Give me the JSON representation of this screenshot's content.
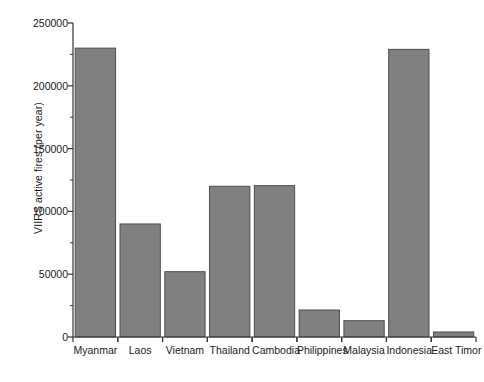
{
  "chart_data": {
    "type": "bar",
    "title": "",
    "xlabel": "",
    "ylabel": "VIIRS active fires (per year)",
    "categories": [
      "Myanmar",
      "Laos",
      "Vietnam",
      "Thailand",
      "Cambodia",
      "Philippines",
      "Malaysia",
      "Indonesia",
      "East Timor"
    ],
    "values": [
      230000,
      90000,
      52000,
      120000,
      120500,
      21500,
      13000,
      229000,
      4000
    ],
    "ylim": [
      0,
      250000
    ],
    "ytick_labels": [
      "0",
      "50000",
      "100000",
      "150000",
      "200000",
      "250000"
    ],
    "ytick_values": [
      0,
      50000,
      100000,
      150000,
      200000,
      250000
    ],
    "minor_tick_interval": 25000,
    "grid": false,
    "legend": false,
    "bar_color": "#808080",
    "bar_edge_color": "#4d4d4d",
    "axis_color": "#333333",
    "background_color": "#ffffff"
  },
  "caption": {
    "text": ""
  }
}
